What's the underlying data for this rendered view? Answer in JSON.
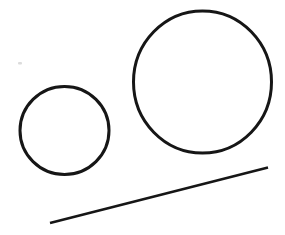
{
  "canvas": {
    "width": 285,
    "height": 235,
    "background_color": "#ffffff"
  },
  "drawing": {
    "description": "line drawing of two circles and a diagonal line",
    "stroke_color": "#161616",
    "shapes": [
      {
        "id": "small-circle",
        "type": "ellipse",
        "cx": 64.5,
        "cy": 130.5,
        "rx": 44.5,
        "ry": 44,
        "stroke_width": 3
      },
      {
        "id": "large-circle",
        "type": "ellipse",
        "cx": 202.5,
        "cy": 82,
        "rx": 69,
        "ry": 71,
        "stroke_width": 3
      },
      {
        "id": "diagonal-line",
        "type": "line",
        "x1": 50,
        "y1": 223,
        "x2": 268,
        "y2": 167.5,
        "stroke_width": 2.6
      }
    ],
    "artifacts": [
      {
        "id": "paper-speck",
        "type": "rect",
        "x": 18,
        "y": 62,
        "width": 4,
        "height": 2.5,
        "color": "#dcdcdc"
      }
    ]
  }
}
